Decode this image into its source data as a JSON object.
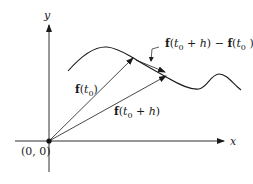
{
  "diagram": {
    "axes": {
      "x_label": "x",
      "y_label": "y",
      "origin_label": "(0, 0)"
    },
    "vectors": [
      {
        "name": "f(t0)",
        "bold": "f",
        "open": "(",
        "var": "t",
        "sub": "0",
        "rest": ")"
      },
      {
        "name": "f(t0 + h)",
        "bold": "f",
        "open": "(",
        "var": "t",
        "sub": "0",
        "rest": " + ",
        "var2": "h",
        "close": ")"
      }
    ],
    "difference_label": {
      "text": "f(t0 + h) − f(t0)",
      "part1_bold": "f",
      "part1_open": "(",
      "part1_var": "t",
      "part1_sub": "0",
      "part1_plus": " + ",
      "part1_h": "h",
      "part1_close": ") − ",
      "part2_bold": "f",
      "part2_open": "(",
      "part2_var": "t",
      "part2_sub": "0",
      "part2_close": " )"
    },
    "colors": {
      "stroke": "#1a1a1a",
      "background": "#ffffff"
    }
  }
}
